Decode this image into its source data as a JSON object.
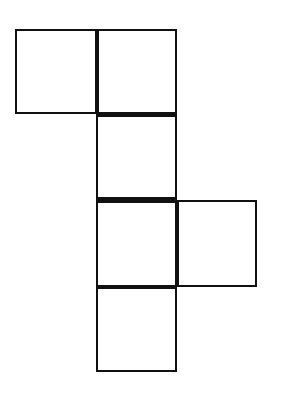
{
  "diagram": {
    "type": "cube-net",
    "face_count": 5,
    "stroke_color": "#111111",
    "fill_color": "#ffffff",
    "faces": [
      {
        "id": "top-left",
        "col": 0,
        "row": 0
      },
      {
        "id": "top-center",
        "col": 1,
        "row": 0
      },
      {
        "id": "middle-center-1",
        "col": 1,
        "row": 1
      },
      {
        "id": "middle-center-2",
        "col": 1,
        "row": 2
      },
      {
        "id": "middle-right",
        "col": 2,
        "row": 2
      },
      {
        "id": "bottom-center",
        "col": 1,
        "row": 3
      }
    ]
  }
}
